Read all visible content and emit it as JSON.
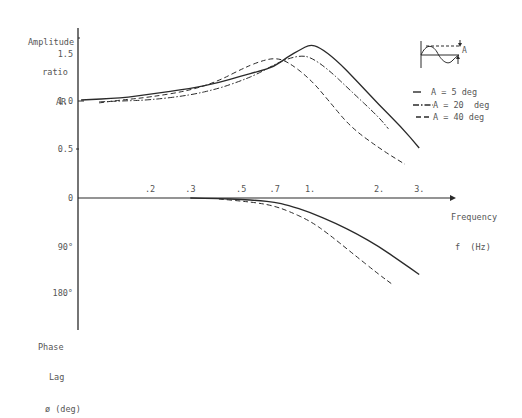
{
  "chart_data": {
    "type": "line",
    "title": "",
    "xlabel": "Frequency f (Hz)",
    "xscale": "log",
    "xticks": [
      {
        "label": ".2",
        "value": 0.2
      },
      {
        "label": ".3",
        "value": 0.3
      },
      {
        "label": ".5",
        "value": 0.5
      },
      {
        "label": ".7",
        "value": 0.7
      },
      {
        "label": "1.",
        "value": 1.0
      },
      {
        "label": "2.",
        "value": 2.0
      },
      {
        "label": "3.",
        "value": 3.0
      }
    ],
    "panels": [
      {
        "name": "amplitude",
        "ylabel": "Amplitude ratio AR",
        "yticks": [
          "1.5",
          "1.0",
          "0.5",
          "0"
        ],
        "ylim": [
          0,
          1.75
        ],
        "series": [
          {
            "name": "A = 5 deg",
            "style": "solid",
            "x": [
              0.1,
              0.15,
              0.2,
              0.3,
              0.4,
              0.5,
              0.6,
              0.7,
              0.8,
              0.9,
              1.0,
              1.1,
              1.3,
              1.6,
              2.0,
              2.5,
              3.0
            ],
            "y": [
              1.0,
              1.02,
              1.06,
              1.12,
              1.18,
              1.25,
              1.3,
              1.35,
              1.45,
              1.52,
              1.58,
              1.55,
              1.42,
              1.2,
              0.95,
              0.72,
              0.5
            ]
          },
          {
            "name": "A = 20 deg",
            "style": "dash-dot",
            "x": [
              0.12,
              0.15,
              0.2,
              0.3,
              0.4,
              0.5,
              0.6,
              0.7,
              0.8,
              0.9,
              1.0,
              1.2,
              1.5,
              2.0,
              2.2
            ],
            "y": [
              0.98,
              0.99,
              1.0,
              1.05,
              1.12,
              1.2,
              1.28,
              1.37,
              1.43,
              1.46,
              1.45,
              1.32,
              1.1,
              0.82,
              0.7
            ]
          },
          {
            "name": "A = 40 deg",
            "style": "dashed",
            "x": [
              0.12,
              0.15,
              0.2,
              0.3,
              0.4,
              0.5,
              0.6,
              0.7,
              0.8,
              1.0,
              1.2,
              1.5,
              2.0,
              2.6
            ],
            "y": [
              0.97,
              1.0,
              1.03,
              1.1,
              1.2,
              1.32,
              1.4,
              1.44,
              1.4,
              1.22,
              1.0,
              0.72,
              0.5,
              0.33
            ]
          }
        ]
      },
      {
        "name": "phase",
        "ylabel": "Phase Lag ø (deg)",
        "yticks": [
          "0",
          "90°",
          "180°"
        ],
        "ylim": [
          0,
          200
        ],
        "series": [
          {
            "name": "A = 5 deg",
            "style": "solid",
            "x": [
              0.3,
              0.4,
              0.5,
              0.6,
              0.7,
              0.8,
              1.0,
              1.3,
              1.6,
              2.0,
              2.5,
              3.0
            ],
            "y": [
              0,
              1,
              3,
              5,
              8,
              14,
              28,
              50,
              70,
              95,
              125,
              150
            ]
          },
          {
            "name": "A = 40 deg",
            "style": "dashed",
            "x": [
              0.4,
              0.5,
              0.6,
              0.7,
              0.8,
              1.0,
              1.2,
              1.5,
              2.0,
              2.3
            ],
            "y": [
              2,
              6,
              10,
              16,
              25,
              45,
              70,
              105,
              150,
              170
            ]
          }
        ]
      }
    ],
    "legend": {
      "position": "right",
      "entries": [
        {
          "style": "solid",
          "label": "A = 5 deg"
        },
        {
          "style": "dash-dot",
          "label": "A = 20  deg"
        },
        {
          "style": "dashed",
          "label": "A = 40 deg"
        }
      ]
    },
    "inset": "small sketch of sinusoidal oscillation with amplitude A marked by arrows"
  },
  "labels": {
    "amp_title_1": "Amplitude",
    "amp_title_2": "ratio",
    "amp_title_3": "AR",
    "y_15": "1.5",
    "y_10": "1.0",
    "y_05": "0.5",
    "y_0": "0",
    "y_90": "90°",
    "y_180": "180°",
    "phase_title_1": "Phase",
    "phase_title_2": "Lag",
    "phase_title_3": "ø (deg)",
    "x_title_1": "Frequency",
    "x_title_2": "f  (Hz)",
    "legend_1": "A = 5 deg",
    "legend_2": "A = 20  deg",
    "legend_3": "A = 40 deg",
    "inset_a": "A"
  },
  "colors": {
    "ink": "#2a2a2a",
    "text": "#555555",
    "background": "#ffffff"
  }
}
